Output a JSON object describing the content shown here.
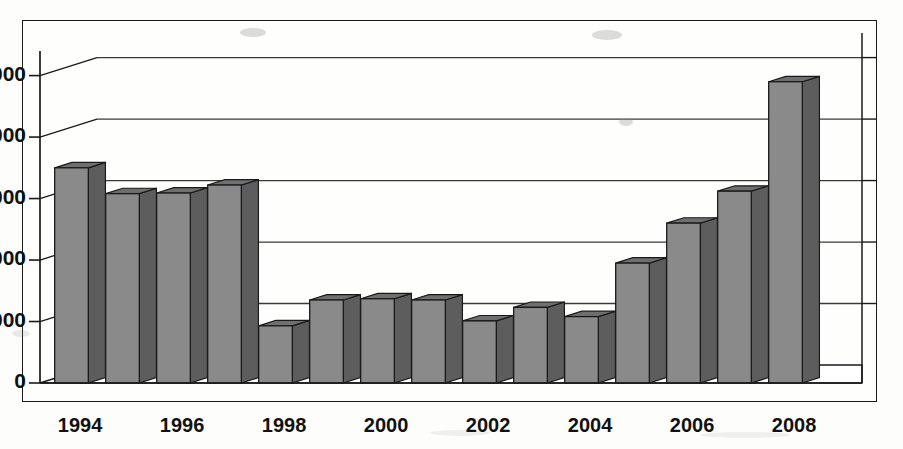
{
  "chart_data": {
    "type": "bar",
    "title": "",
    "subtitle": "",
    "xlabel": "",
    "ylabel": "",
    "categories": [
      "1994",
      "1995",
      "1996",
      "1997",
      "1998",
      "1999",
      "2000",
      "2001",
      "2002",
      "2003",
      "2004",
      "2005",
      "2006",
      "2007",
      "2008"
    ],
    "values": [
      3500,
      3080,
      3090,
      3220,
      930,
      1350,
      1370,
      1350,
      1010,
      1230,
      1080,
      1950,
      2600,
      3120,
      4900
    ],
    "x_tick_labels": [
      "1994",
      "1996",
      "1998",
      "2000",
      "2002",
      "2004",
      "2006",
      "2008"
    ],
    "x_tick_categories": [
      "1994",
      "1996",
      "1998",
      "2000",
      "2002",
      "2004",
      "2006",
      "2008"
    ],
    "y_tick_labels": [
      "0",
      "1,000",
      "2,000",
      "3,000",
      "4,000",
      "5,000"
    ],
    "y_tick_values": [
      0,
      1000,
      2000,
      3000,
      4000,
      5000
    ],
    "ylim": [
      0,
      5400
    ],
    "grid": true,
    "grid_axis": "y",
    "legend": false,
    "legend_position": "none",
    "style": "3d-column",
    "bar_face_color": "#8a8a8a",
    "bar_top_color": "#6f6f6f",
    "bar_side_color": "#5d5d5d",
    "bar_outline_color": "#1a1a1a",
    "axis_color": "#1a1a1a",
    "gridline_color": "#3a3a3a",
    "background_color": "#fefefd",
    "frame_color": "#1a1a1a"
  },
  "figure": {
    "frame_label": "chart-frame",
    "plot_label": "plot-area"
  }
}
